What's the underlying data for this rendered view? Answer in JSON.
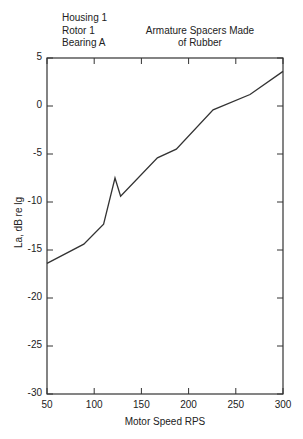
{
  "chart_data": {
    "type": "line",
    "title": "",
    "annotations": {
      "left": [
        "Housing 1",
        "Rotor 1",
        "Bearing A"
      ],
      "right": [
        "Armature Spacers Made",
        "of Rubber"
      ]
    },
    "xlabel": "Motor Speed RPS",
    "ylabel": "La, dB re lg",
    "xlim": [
      50,
      300
    ],
    "ylim": [
      -30,
      5
    ],
    "xticks": [
      50,
      100,
      150,
      200,
      250,
      300
    ],
    "yticks": [
      5,
      0,
      -5,
      -10,
      -15,
      -20,
      -25,
      -30
    ],
    "xtick_labels": [
      "50",
      "100",
      "150",
      "200",
      "250",
      "300"
    ],
    "ytick_labels": [
      "5",
      "0",
      "-5",
      "-10",
      "-15",
      "-20",
      "-25",
      "-30"
    ],
    "grid": false,
    "legend": null,
    "series": [
      {
        "name": "La",
        "x": [
          50,
          89,
          110,
          122,
          128,
          167,
          187,
          226,
          265,
          300
        ],
        "y": [
          -16.4,
          -14.4,
          -12.3,
          -7.5,
          -9.4,
          -5.4,
          -4.5,
          -0.4,
          1.2,
          3.6
        ]
      }
    ]
  }
}
